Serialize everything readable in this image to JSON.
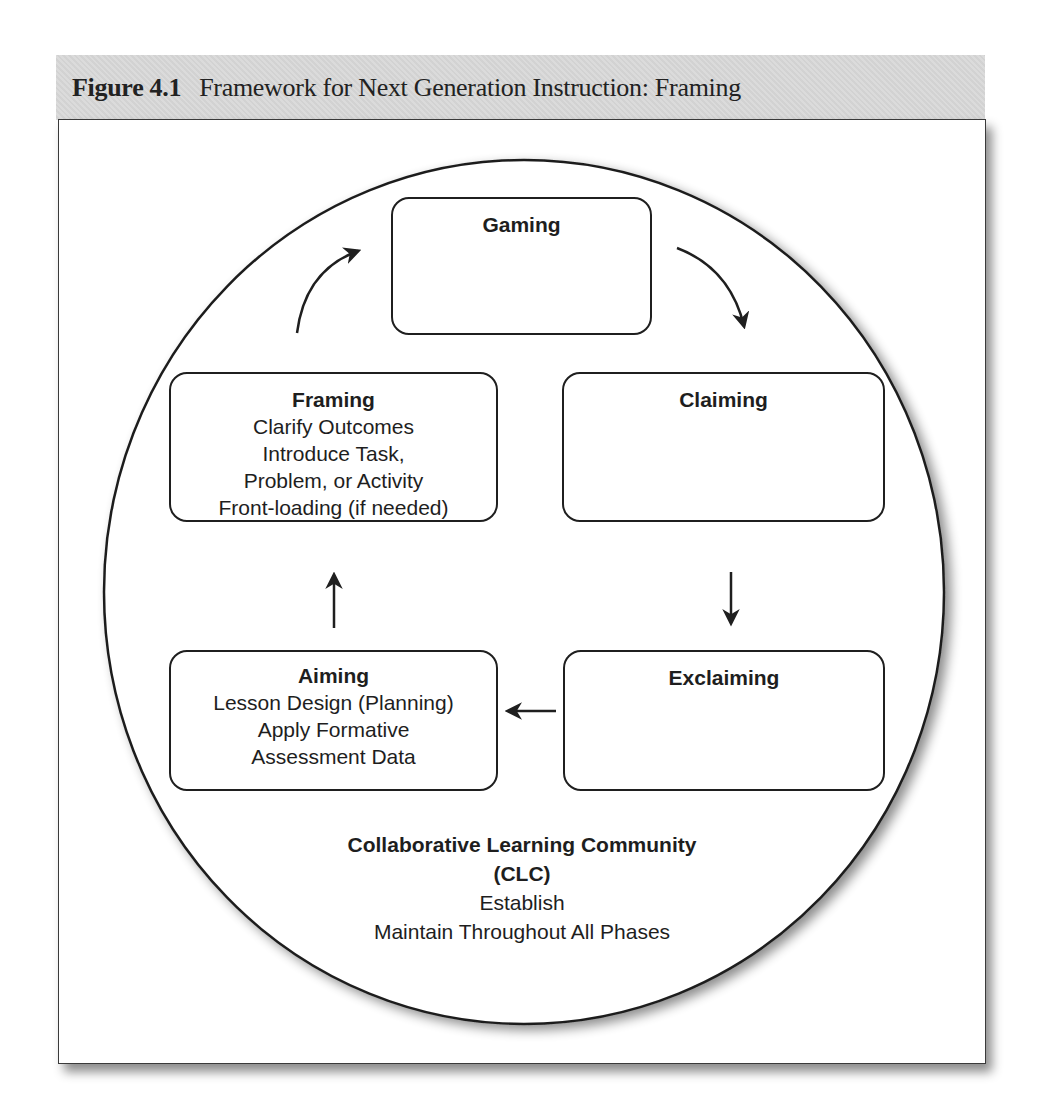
{
  "figure": {
    "label": "Figure 4.1",
    "title": "Framework for Next Generation Instruction: Framing",
    "header_bg_color": "#d9d9d9"
  },
  "phases": {
    "gaming": {
      "title": "Gaming",
      "lines": []
    },
    "claiming": {
      "title": "Claiming",
      "lines": []
    },
    "exclaiming": {
      "title": "Exclaiming",
      "lines": []
    },
    "aiming": {
      "title": "Aiming",
      "lines": [
        "Lesson Design (Planning)",
        "Apply Formative",
        "Assessment Data"
      ]
    },
    "framing": {
      "title": "Framing",
      "lines": [
        "Clarify Outcomes",
        "Introduce Task,",
        "Problem, or Activity",
        "Front-loading (if needed)"
      ]
    }
  },
  "cycle_order": [
    "Framing",
    "Gaming",
    "Claiming",
    "Exclaiming",
    "Aiming"
  ],
  "community": {
    "title_line1": "Collaborative Learning Community",
    "title_line2": "(CLC)",
    "lines": [
      "Establish",
      "Maintain Throughout All Phases"
    ]
  },
  "colors": {
    "stroke": "#1f1f1f",
    "text": "#1e1e1e",
    "background": "#ffffff"
  }
}
